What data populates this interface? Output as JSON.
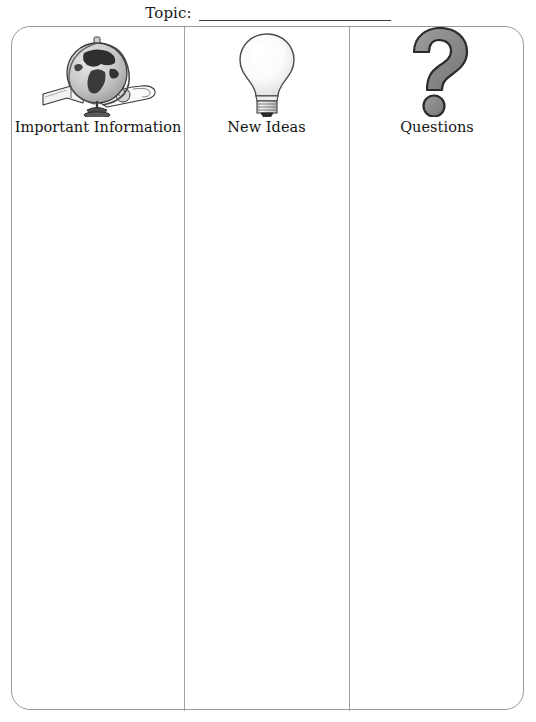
{
  "worksheet": {
    "topic": {
      "label": "Topic:",
      "value": "",
      "placeholder": ""
    },
    "columns": [
      {
        "id": "important-information",
        "heading": "Important Information",
        "icon": "globe-icon",
        "notes": ""
      },
      {
        "id": "new-ideas",
        "heading": "New Ideas",
        "icon": "lightbulb-icon",
        "notes": ""
      },
      {
        "id": "questions",
        "heading": "Questions",
        "icon": "question-mark-icon",
        "notes": ""
      }
    ]
  },
  "colors": {
    "frame_border": "#9a9a9a",
    "divider": "#a2a2a2",
    "text": "#141414",
    "rule_line": "#3b3b3b",
    "icon_gray": "#8a8a8a",
    "icon_outline": "#2b2b2b",
    "page_background": "#ffffff"
  }
}
